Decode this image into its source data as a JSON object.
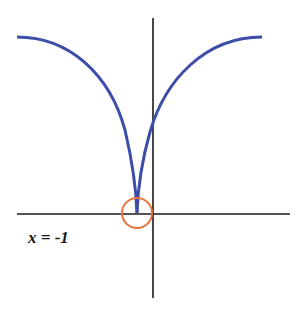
{
  "diagram": {
    "label": "x = -1",
    "colors": {
      "curve": "#3d4ea8",
      "axis": "#1a1a1a",
      "highlight_circle": "#e8743a"
    },
    "annotation": "cusp at x = -1 circled"
  }
}
